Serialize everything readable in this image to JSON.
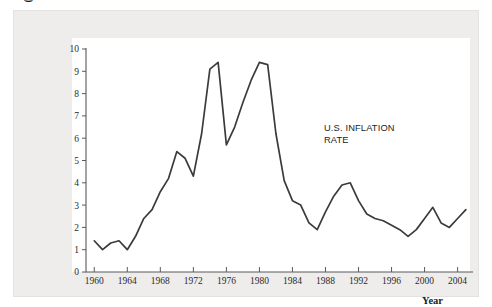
{
  "figure": {
    "background_color": "#eeedec",
    "plot_background_color": "#ffffff",
    "line_color": "#3c3b3a",
    "axis_color": "#5a5a5a"
  },
  "labels": {
    "y_axis_line1": "Inflation rate",
    "y_axis_line2": "(percent per year)",
    "x_axis": "Year",
    "annotation_line1": "U.S. INFLATION",
    "annotation_line2": "RATE"
  },
  "chart_data": {
    "type": "line",
    "title": "",
    "subtitle": "",
    "xlabel": "Year",
    "ylabel": "Inflation rate (percent per year)",
    "xlim": [
      1959,
      2005.5
    ],
    "ylim": [
      0,
      10
    ],
    "grid": false,
    "legend": false,
    "annotations": [
      {
        "text": "U.S. INFLATION RATE",
        "x": 1989,
        "y": 7.1
      }
    ],
    "y_ticks": [
      0,
      1,
      2,
      3,
      4,
      5,
      6,
      7,
      8,
      9,
      10
    ],
    "y_tick_labels": [
      "0",
      "1",
      "2",
      "3",
      "4",
      "5",
      "6",
      "7",
      "8",
      "9",
      "10"
    ],
    "x_ticks": [
      1960,
      1964,
      1968,
      1972,
      1976,
      1980,
      1984,
      1988,
      1992,
      1996,
      2000,
      2004
    ],
    "x_tick_labels": [
      "1960",
      "1964",
      "1968",
      "1972",
      "1976",
      "1980",
      "1984",
      "1988",
      "1992",
      "1996",
      "2000",
      "2004"
    ],
    "series": [
      {
        "name": "U.S. inflation rate",
        "x": [
          1960,
          1961,
          1962,
          1963,
          1964,
          1965,
          1966,
          1967,
          1968,
          1969,
          1970,
          1971,
          1972,
          1973,
          1974,
          1975,
          1976,
          1977,
          1978,
          1979,
          1980,
          1981,
          1982,
          1983,
          1984,
          1985,
          1986,
          1987,
          1988,
          1989,
          1990,
          1991,
          1992,
          1993,
          1994,
          1995,
          1996,
          1997,
          1998,
          1999,
          2000,
          2001,
          2002,
          2003,
          2004,
          2005
        ],
        "values": [
          1.4,
          1.0,
          1.3,
          1.4,
          1.0,
          1.6,
          2.4,
          2.8,
          3.6,
          4.2,
          5.4,
          5.1,
          4.3,
          6.2,
          9.1,
          9.4,
          5.7,
          6.5,
          7.6,
          8.6,
          9.4,
          9.3,
          6.2,
          4.1,
          3.2,
          3.0,
          2.2,
          1.9,
          2.7,
          3.4,
          3.9,
          4.0,
          3.2,
          2.6,
          2.4,
          2.3,
          2.1,
          1.9,
          1.6,
          1.9,
          2.4,
          2.9,
          2.2,
          2.0,
          2.4,
          2.8
        ]
      }
    ]
  }
}
